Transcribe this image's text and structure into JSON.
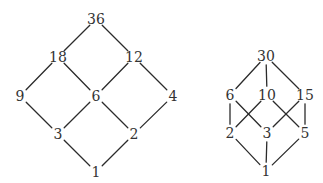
{
  "diagrams": [
    {
      "name": "divisor-lattice-36",
      "nodes": [
        {
          "id": "36",
          "label": "36",
          "x": 96,
          "y": 19
        },
        {
          "id": "18",
          "label": "18",
          "x": 58,
          "y": 57
        },
        {
          "id": "12",
          "label": "12",
          "x": 134,
          "y": 57
        },
        {
          "id": "9",
          "label": "9",
          "x": 20,
          "y": 96
        },
        {
          "id": "6",
          "label": "6",
          "x": 96,
          "y": 96
        },
        {
          "id": "4",
          "label": "4",
          "x": 173,
          "y": 96
        },
        {
          "id": "3",
          "label": "3",
          "x": 58,
          "y": 134
        },
        {
          "id": "2",
          "label": "2",
          "x": 134,
          "y": 134
        },
        {
          "id": "1",
          "label": "1",
          "x": 96,
          "y": 172
        }
      ],
      "edges": [
        [
          "36",
          "18"
        ],
        [
          "36",
          "12"
        ],
        [
          "18",
          "9"
        ],
        [
          "18",
          "6"
        ],
        [
          "12",
          "6"
        ],
        [
          "12",
          "4"
        ],
        [
          "9",
          "3"
        ],
        [
          "6",
          "3"
        ],
        [
          "6",
          "2"
        ],
        [
          "4",
          "2"
        ],
        [
          "3",
          "1"
        ],
        [
          "2",
          "1"
        ]
      ]
    },
    {
      "name": "divisor-lattice-30",
      "nodes": [
        {
          "id": "30",
          "label": "30",
          "x": 266,
          "y": 56
        },
        {
          "id": "6",
          "label": "6",
          "x": 230,
          "y": 95
        },
        {
          "id": "10",
          "label": "10",
          "x": 267,
          "y": 95
        },
        {
          "id": "15",
          "label": "15",
          "x": 305,
          "y": 95
        },
        {
          "id": "2",
          "label": "2",
          "x": 230,
          "y": 133
        },
        {
          "id": "3",
          "label": "3",
          "x": 267,
          "y": 133
        },
        {
          "id": "5",
          "label": "5",
          "x": 305,
          "y": 133
        },
        {
          "id": "1",
          "label": "1",
          "x": 266,
          "y": 171
        }
      ],
      "edges": [
        [
          "30",
          "6"
        ],
        [
          "30",
          "10"
        ],
        [
          "30",
          "15"
        ],
        [
          "6",
          "2"
        ],
        [
          "6",
          "3"
        ],
        [
          "10",
          "2"
        ],
        [
          "10",
          "5"
        ],
        [
          "15",
          "3"
        ],
        [
          "15",
          "5"
        ],
        [
          "2",
          "1"
        ],
        [
          "3",
          "1"
        ],
        [
          "5",
          "1"
        ]
      ]
    }
  ]
}
